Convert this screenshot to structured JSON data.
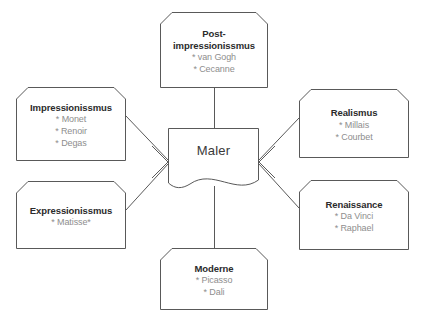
{
  "diagram": {
    "title": "Maler",
    "type": "mind-map",
    "stroke_color": "#595959",
    "title_text_color": "#2b2b2b",
    "item_text_color": "#8e8e8e",
    "background_color": "#ffffff",
    "center": {
      "label": "Maler"
    },
    "nodes": [
      {
        "id": "post-impressionissmus",
        "title": "Post-impressionissmus",
        "title_line1": "Post-",
        "title_line2": "impressionissmus",
        "items": [
          "* van Gogh",
          "* Cecanne"
        ]
      },
      {
        "id": "impressionissmus",
        "title": "Impressionissmus",
        "items": [
          "* Monet",
          "* Renoir",
          "* Degas"
        ]
      },
      {
        "id": "expressionissmus",
        "title": "Expressionissmus",
        "items": [
          "* Matisse*"
        ]
      },
      {
        "id": "realismus",
        "title": "Realismus",
        "items": [
          "* Millais",
          "* Courbet"
        ]
      },
      {
        "id": "renaissance",
        "title": "Renaissance",
        "items": [
          "* Da Vinci",
          "* Raphael"
        ]
      },
      {
        "id": "moderne",
        "title": "Moderne",
        "items": [
          "* Picasso",
          "* Dali"
        ]
      }
    ]
  }
}
